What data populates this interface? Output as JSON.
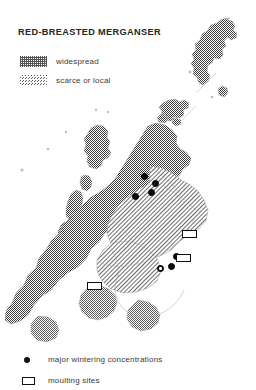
{
  "title": "RED-BREASTED MERGANSER",
  "legend_top": {
    "items": [
      {
        "swatch": "checker-dense-pattern-swatch",
        "label": "widespread"
      },
      {
        "swatch": "diagonal-hatch-pattern-swatch",
        "label": "scarce or local"
      }
    ]
  },
  "legend_bottom": {
    "items": [
      {
        "symbol": "filled-circle-icon",
        "label": "major wintering concentrations"
      },
      {
        "symbol": "open-rectangle-icon",
        "label": "moulting sites"
      }
    ]
  },
  "map": {
    "region": "Scotland",
    "colors": {
      "widespread_fill": "#4a4a4a",
      "scarce_fill": "#5a5a5a",
      "coastline": "#9a9a9a",
      "symbol": "#0d0d0d",
      "background": "#ffffff"
    },
    "wintering_dots": [
      {
        "name": "dot-moray-firth-north",
        "x": 141,
        "y": 173
      },
      {
        "name": "dot-moray-firth-east",
        "x": 152,
        "y": 180
      },
      {
        "name": "dot-moray-firth-inner",
        "x": 148,
        "y": 189
      },
      {
        "name": "dot-beauly-firth",
        "x": 132,
        "y": 193
      },
      {
        "name": "dot-firth-of-tay",
        "x": 173,
        "y": 253
      },
      {
        "name": "dot-firth-of-forth-west",
        "x": 157,
        "y": 265
      },
      {
        "name": "dot-firth-of-forth-mid",
        "x": 168,
        "y": 263
      }
    ],
    "moulting_rects": [
      {
        "name": "rect-aberdeenshire-coast",
        "x": 182,
        "y": 230
      },
      {
        "name": "rect-firth-of-tay-coast",
        "x": 176,
        "y": 254
      },
      {
        "name": "rect-inner-hebrides",
        "x": 87,
        "y": 282
      }
    ]
  }
}
